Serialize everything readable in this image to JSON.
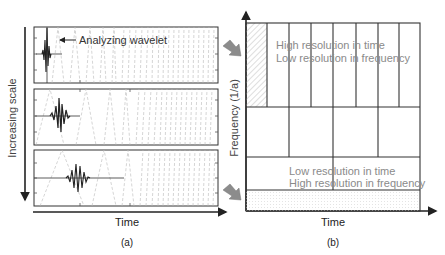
{
  "panel_a": {
    "caption": "(a)",
    "y_axis_label": "Increasing scale",
    "x_axis_label": "Time",
    "annotation": "Analyzing wavelet",
    "boxes": [
      {
        "name": "small-scale",
        "wavelet_center_x": 46,
        "wavelet_width": 8
      },
      {
        "name": "medium-scale",
        "wavelet_center_x": 60,
        "wavelet_width": 16
      },
      {
        "name": "large-scale",
        "wavelet_center_x": 80,
        "wavelet_width": 36
      }
    ]
  },
  "panel_b": {
    "caption": "(b)",
    "y_axis_label": "Frequency (1/a)",
    "x_axis_label": "Time",
    "top_text_line1": "High resolution in time",
    "top_text_line2": "Low resolution in frequency",
    "bottom_text_line1": "Low resolution in time",
    "bottom_text_line2": "High resolution in frequency",
    "rows": [
      {
        "divisions": 8
      },
      {
        "divisions": 4
      },
      {
        "divisions": 2
      },
      {
        "divisions": 1
      }
    ]
  },
  "colors": {
    "line": "#222222",
    "grid": "#333333",
    "dashed": "#b8b8b8",
    "text_gray": "#8a8a8a",
    "arrow_fill": "#8c8c8c",
    "hatch": "#c8c8c8"
  }
}
